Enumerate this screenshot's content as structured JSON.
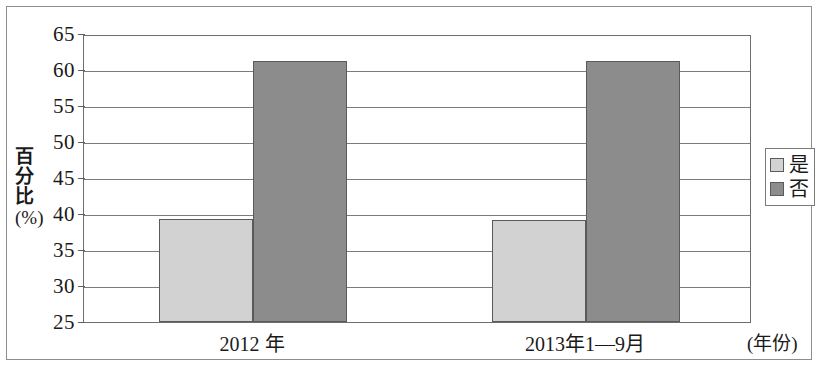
{
  "chart_data": {
    "type": "bar",
    "title": "",
    "xlabel": "(年份)",
    "ylabel": "百分比(%)",
    "ylabel_chars": [
      "百",
      "分",
      "比"
    ],
    "ylabel_unit": "(%)",
    "categories": [
      "2012 年",
      "2013年1—9月"
    ],
    "ylim": [
      25,
      65
    ],
    "yticks": [
      65,
      60,
      55,
      50,
      45,
      40,
      35,
      30,
      25
    ],
    "grid": true,
    "legend_position": "right",
    "series": [
      {
        "name": "是",
        "color": "#d2d2d2",
        "values": [
          39.3,
          39.1
        ]
      },
      {
        "name": "否",
        "color": "#8c8c8c",
        "values": [
          61.2,
          61.2
        ]
      }
    ]
  },
  "legend": {
    "items": [
      {
        "label": "是",
        "color": "#d2d2d2"
      },
      {
        "label": "否",
        "color": "#8c8c8c"
      }
    ]
  },
  "axis": {
    "y_title_chars": [
      "百",
      "分",
      "比"
    ],
    "y_title_unit": "(%)",
    "x_title": "(年份)",
    "tick_labels": [
      "65",
      "60",
      "55",
      "50",
      "45",
      "40",
      "35",
      "30",
      "25"
    ],
    "category_labels": [
      "2012 年",
      "2013年1—9月"
    ]
  },
  "bars": [
    {
      "group": "2012 年",
      "series": "是",
      "value": 39.3,
      "variant": "light"
    },
    {
      "group": "2012 年",
      "series": "否",
      "value": 61.2,
      "variant": "dark"
    },
    {
      "group": "2013年1—9月",
      "series": "是",
      "value": 39.1,
      "variant": "light"
    },
    {
      "group": "2013年1—9月",
      "series": "否",
      "value": 61.2,
      "variant": "dark"
    }
  ]
}
